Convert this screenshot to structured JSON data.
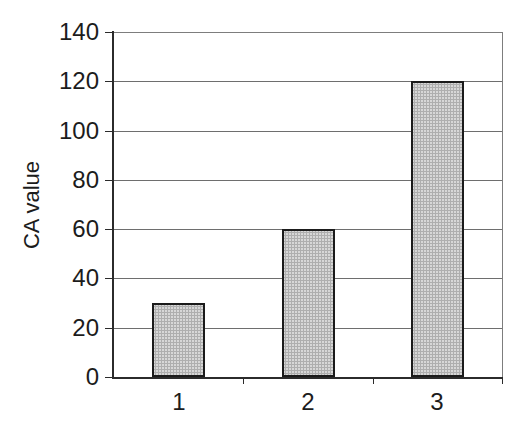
{
  "chart_data": {
    "type": "bar",
    "categories": [
      "1",
      "2",
      "3"
    ],
    "values": [
      30,
      60,
      120
    ],
    "title": "",
    "xlabel": "",
    "ylabel": "CA value",
    "ylim": [
      0,
      140
    ],
    "yticks": [
      0,
      20,
      40,
      60,
      80,
      100,
      120,
      140
    ],
    "ytick_step": 20,
    "grid": "horizontal gridlines on, vertical off",
    "legend": "none",
    "plot_background": "#ffffff",
    "bar_fill_color": "#d2d2d2",
    "bar_pattern": "halftone-dots",
    "bar_border_color": "#1b1b1b",
    "axis_color": "#2b2b2b",
    "gridline_color": "#6e6e6e",
    "frame_color": "#7d7d7d",
    "text_color": "#1c1c1c"
  }
}
